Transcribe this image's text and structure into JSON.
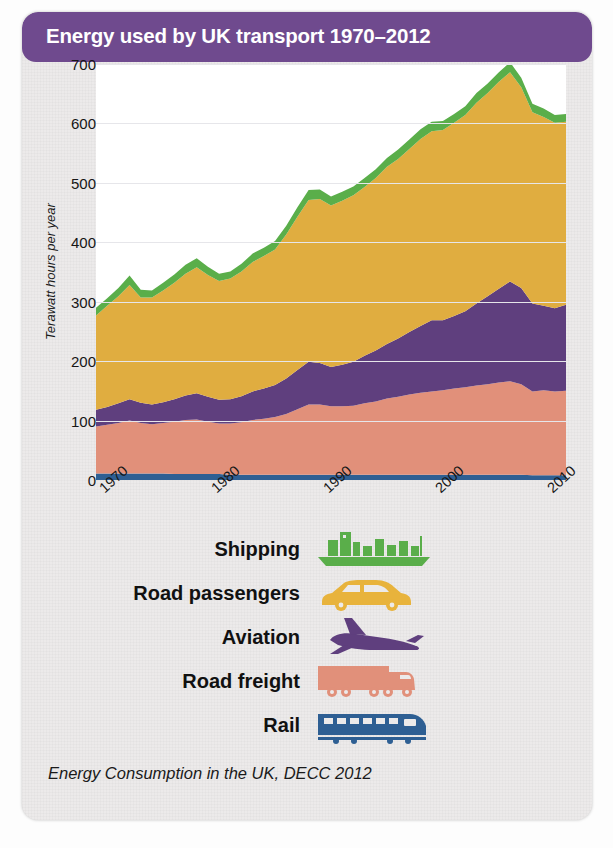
{
  "header": {
    "title": "Energy used by UK transport 1970–2012"
  },
  "caption": "Energy Consumption in the UK, DECC 2012",
  "legend": {
    "items": [
      {
        "label": "Shipping",
        "icon": "ship-icon",
        "color": "#5aae4a"
      },
      {
        "label": "Road passengers",
        "icon": "car-icon",
        "color": "#e8b33c"
      },
      {
        "label": "Aviation",
        "icon": "plane-icon",
        "color": "#5f3f7e"
      },
      {
        "label": "Road freight",
        "icon": "truck-icon",
        "color": "#e1907a"
      },
      {
        "label": "Rail",
        "icon": "train-icon",
        "color": "#2e5f93"
      }
    ]
  },
  "colors": {
    "header_purple": "#6f4a8e",
    "card_background": "#eceaea",
    "plot_background": "#ffffff",
    "gridline": "#e6e6ea",
    "shipping": "#5aae4a",
    "road_passengers": "#e0ad40",
    "aviation": "#5f3f7e",
    "road_freight": "#e1907a",
    "rail": "#2e5f93"
  },
  "chart_data": {
    "type": "area",
    "stacked": true,
    "title": "Energy used by UK transport 1970–2012",
    "xlabel": "",
    "ylabel": "Terawatt hours per year",
    "source": "Energy Consumption in the UK, DECC 2012",
    "xlim": [
      1970,
      2012
    ],
    "ylim": [
      0,
      700
    ],
    "yticks": [
      0,
      100,
      200,
      300,
      400,
      500,
      600,
      700
    ],
    "xticks": [
      1970,
      1980,
      1990,
      2000,
      2010
    ],
    "grid": true,
    "legend_position": "below",
    "x": [
      1970,
      1971,
      1972,
      1973,
      1974,
      1975,
      1976,
      1977,
      1978,
      1979,
      1980,
      1981,
      1982,
      1983,
      1984,
      1985,
      1986,
      1987,
      1988,
      1989,
      1990,
      1991,
      1992,
      1993,
      1994,
      1995,
      1996,
      1997,
      1998,
      1999,
      2000,
      2001,
      2002,
      2003,
      2004,
      2005,
      2006,
      2007,
      2008,
      2009,
      2010,
      2011,
      2012
    ],
    "series": [
      {
        "name": "Rail",
        "color": "#2e5f93",
        "values": [
          11,
          11,
          11,
          11,
          11,
          11,
          11,
          10,
          10,
          10,
          10,
          10,
          9,
          9,
          9,
          9,
          9,
          9,
          9,
          9,
          9,
          9,
          9,
          9,
          9,
          9,
          9,
          9,
          9,
          9,
          9,
          9,
          9,
          9,
          9,
          9,
          9,
          9,
          9,
          8,
          8,
          8,
          8
        ]
      },
      {
        "name": "Road freight",
        "color": "#e1907a",
        "values": [
          79,
          82,
          85,
          89,
          85,
          83,
          85,
          88,
          91,
          92,
          88,
          85,
          86,
          88,
          92,
          94,
          97,
          102,
          110,
          118,
          118,
          115,
          115,
          116,
          120,
          123,
          128,
          131,
          135,
          138,
          140,
          142,
          145,
          147,
          150,
          152,
          155,
          157,
          152,
          141,
          143,
          141,
          142
        ]
      },
      {
        "name": "Aviation",
        "color": "#5f3f7e",
        "values": [
          28,
          30,
          33,
          36,
          34,
          33,
          35,
          38,
          41,
          44,
          42,
          40,
          41,
          44,
          48,
          51,
          54,
          60,
          66,
          72,
          70,
          66,
          70,
          74,
          80,
          86,
          92,
          98,
          105,
          112,
          120,
          118,
          122,
          128,
          138,
          148,
          158,
          168,
          162,
          148,
          142,
          140,
          145
        ]
      },
      {
        "name": "Road passengers",
        "color": "#e0ad40",
        "values": [
          159,
          170,
          180,
          192,
          177,
          180,
          188,
          196,
          205,
          212,
          205,
          200,
          203,
          210,
          218,
          223,
          228,
          242,
          258,
          272,
          276,
          272,
          276,
          280,
          284,
          290,
          298,
          302,
          308,
          315,
          318,
          320,
          325,
          330,
          338,
          342,
          348,
          352,
          338,
          322,
          318,
          312,
          308
        ]
      },
      {
        "name": "Shipping",
        "color": "#5aae4a",
        "values": [
          13,
          13,
          14,
          16,
          13,
          12,
          13,
          14,
          15,
          15,
          14,
          12,
          12,
          13,
          14,
          14,
          14,
          15,
          16,
          17,
          16,
          15,
          15,
          15,
          15,
          15,
          15,
          16,
          16,
          16,
          16,
          15,
          15,
          15,
          16,
          16,
          16,
          17,
          16,
          14,
          14,
          13,
          13
        ]
      }
    ],
    "totals": [
      290,
      306,
      323,
      344,
      320,
      319,
      332,
      346,
      362,
      373,
      359,
      347,
      351,
      364,
      381,
      391,
      402,
      428,
      459,
      488,
      489,
      477,
      485,
      494,
      508,
      523,
      542,
      556,
      573,
      590,
      603,
      604,
      616,
      629,
      651,
      667,
      686,
      703,
      677,
      633,
      625,
      614,
      616
    ]
  }
}
